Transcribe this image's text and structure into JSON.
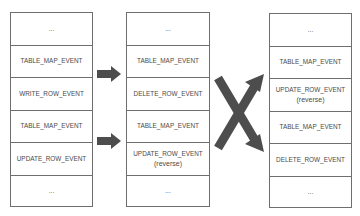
{
  "diagram": {
    "type": "binlog-event-reversal",
    "stacks": [
      {
        "name": "original",
        "cells": [
          {
            "label": "...",
            "sub": ""
          },
          {
            "label": "TABLE_MAP_EVENT",
            "sub": ""
          },
          {
            "label": "WRITE_ROW_EVENT",
            "sub": ""
          },
          {
            "label": "TABLE_MAP_EVENT",
            "sub": ""
          },
          {
            "label": "UPDATE_ROW_EVENT",
            "sub": ""
          },
          {
            "label": "...",
            "sub": ""
          }
        ]
      },
      {
        "name": "reversed-events",
        "cells": [
          {
            "label": "...",
            "sub": ""
          },
          {
            "label": "TABLE_MAP_EVENT",
            "sub": ""
          },
          {
            "label": "DELETE_ROW_EVENT",
            "sub": ""
          },
          {
            "label": "TABLE_MAP_EVENT",
            "sub": ""
          },
          {
            "label": "UPDATE_ROW_EVENT",
            "sub": "(reverse)"
          },
          {
            "label": "...",
            "sub": ""
          }
        ]
      },
      {
        "name": "reversed-order",
        "cells": [
          {
            "label": "...",
            "sub": ""
          },
          {
            "label": "TABLE_MAP_EVENT",
            "sub": ""
          },
          {
            "label": "UPDATE_ROW_EVENT",
            "sub": "(reverse)"
          },
          {
            "label": "TABLE_MAP_EVENT",
            "sub": ""
          },
          {
            "label": "DELETE_ROW_EVENT",
            "sub": ""
          },
          {
            "label": "...",
            "sub": ""
          }
        ]
      }
    ],
    "connectors": [
      {
        "from": "original.row2",
        "to": "reversed-events.row2",
        "type": "block-arrow"
      },
      {
        "from": "original.row4",
        "to": "reversed-events.row4",
        "type": "block-arrow"
      },
      {
        "from": "reversed-events",
        "to": "reversed-order",
        "type": "crossing-arrows"
      }
    ],
    "colors": {
      "border": "#6e6e6e",
      "text": "#4a4a4a",
      "arrow": "#4d4d4d",
      "background": "#ffffff"
    }
  }
}
